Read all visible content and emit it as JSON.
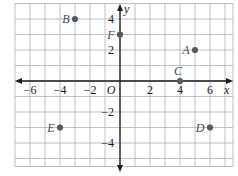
{
  "chart_data": {
    "type": "scatter",
    "title": "",
    "xlabel": "x",
    "ylabel": "y",
    "origin_label": "O",
    "xlim": [
      -7.3,
      7.5
    ],
    "ylim": [
      -5.5,
      5.0
    ],
    "grid": true,
    "legend": false,
    "x_tick_values": [
      -6,
      -4,
      -2,
      2,
      4,
      6
    ],
    "x_tick_labels": [
      "-6",
      "-4",
      "-2",
      "2",
      "4",
      "6"
    ],
    "y_tick_values": [
      4,
      2,
      -2,
      -4
    ],
    "y_tick_labels": [
      "4",
      "2",
      "-2",
      "-4"
    ],
    "points": [
      {
        "label": "A",
        "x": 5,
        "y": 2,
        "label_pos": "left"
      },
      {
        "label": "B",
        "x": -3,
        "y": 4,
        "label_pos": "left"
      },
      {
        "label": "C",
        "x": 4,
        "y": 0,
        "label_pos": "above"
      },
      {
        "label": "D",
        "x": 6,
        "y": -3,
        "label_pos": "left"
      },
      {
        "label": "E",
        "x": -4,
        "y": -3,
        "label_pos": "left"
      },
      {
        "label": "F",
        "x": 0,
        "y": 3,
        "label_pos": "left"
      }
    ],
    "colors": {
      "background": "#ffffff",
      "grid": "#adb1b6",
      "axis": "#1b1b1b",
      "point": "#565a5e",
      "point_label": "#474b4f",
      "tick_label": "#1b1b1b"
    }
  }
}
